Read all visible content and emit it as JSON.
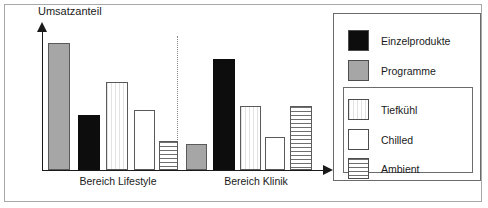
{
  "chart_data": {
    "type": "bar",
    "title": "",
    "ylabel": "Umsatzanteil",
    "xlabel": "",
    "grid": false,
    "legend_position": "right",
    "axis_y_arrow": true,
    "axis_x_arrow": true,
    "group_divider": "dotted",
    "categories": [
      "Bereich Lifestyle",
      "Bereich Klinik"
    ],
    "series": [
      {
        "name": "Programme",
        "style": "gray",
        "values": [
          90,
          18
        ]
      },
      {
        "name": "Einzelprodukte",
        "style": "black",
        "values": [
          39,
          78
        ]
      },
      {
        "name": "Tiefkühl",
        "style": "tiefkuehl",
        "values": [
          62,
          45
        ]
      },
      {
        "name": "Chilled",
        "style": "chilled",
        "values": [
          43,
          23
        ]
      },
      {
        "name": "Ambient",
        "style": "ambient",
        "values": [
          20,
          45
        ]
      }
    ],
    "bars": [
      {
        "group": "Bereich Lifestyle",
        "series": "Programme",
        "style": "gray",
        "left": 48,
        "width": 22,
        "height": 127
      },
      {
        "group": "Bereich Lifestyle",
        "series": "Einzelprodukte",
        "style": "black",
        "left": 78,
        "width": 22,
        "height": 55
      },
      {
        "group": "Bereich Lifestyle",
        "series": "Tiefkühl",
        "style": "tiefkuehl",
        "left": 106,
        "width": 22,
        "height": 88
      },
      {
        "group": "Bereich Lifestyle",
        "series": "Chilled",
        "style": "chilled",
        "left": 134,
        "width": 21,
        "height": 60
      },
      {
        "group": "Bereich Lifestyle",
        "series": "Ambient",
        "style": "ambient",
        "left": 159,
        "width": 19,
        "height": 29
      },
      {
        "group": "Bereich Klinik",
        "series": "Programme",
        "style": "gray",
        "left": 186,
        "width": 21,
        "height": 26
      },
      {
        "group": "Bereich Klinik",
        "series": "Einzelprodukte",
        "style": "black",
        "left": 213,
        "width": 22,
        "height": 111
      },
      {
        "group": "Bereich Klinik",
        "series": "Tiefkühl",
        "style": "tiefkuehl",
        "left": 240,
        "width": 21,
        "height": 64
      },
      {
        "group": "Bereich Klinik",
        "series": "Chilled",
        "style": "chilled",
        "left": 265,
        "width": 20,
        "height": 33
      },
      {
        "group": "Bereich Klinik",
        "series": "Ambient",
        "style": "ambient",
        "left": 290,
        "width": 22,
        "height": 64
      }
    ],
    "group_labels": [
      {
        "text": "Bereich Lifestyle",
        "left": 58,
        "width": 120
      },
      {
        "text": "Bereich Klinik",
        "left": 200,
        "width": 112
      }
    ]
  },
  "legend": {
    "top_items": [
      {
        "label": "Einzelprodukte",
        "style": "black",
        "top": 16
      },
      {
        "label": "Programme",
        "style": "gray",
        "top": 46
      }
    ],
    "grouped_items": [
      {
        "label": "Tiefkühl",
        "style": "tiefkuehl",
        "top": 85
      },
      {
        "label": "Chilled",
        "style": "chilled",
        "top": 115
      },
      {
        "label": "Ambient",
        "style": "ambient",
        "top": 144
      }
    ]
  },
  "colors": {
    "black": "#0d0d0d",
    "gray": "#a6a6a6",
    "outline": "#4d4d4d",
    "axis": "#1a1a1a",
    "frame": "#a8a8a8",
    "divider": "#8a8a8a"
  }
}
